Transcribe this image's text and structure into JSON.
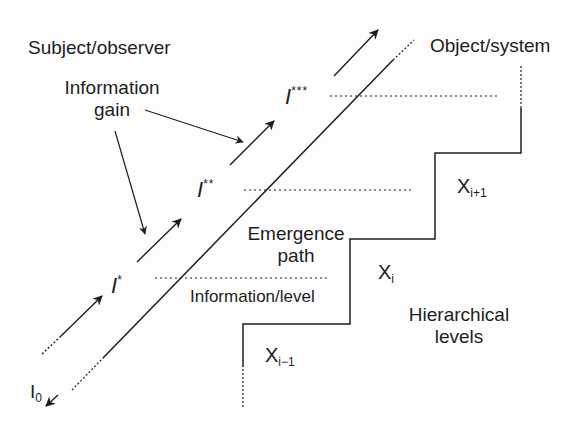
{
  "labels": {
    "subject_observer": "Subject/observer",
    "information_gain_line1": "Information",
    "information_gain_line2": "gain",
    "object_system": "Object/system",
    "emergence_path_line1": "Emergence",
    "emergence_path_line2": "path",
    "information_level": "Information/level",
    "hierarchical_levels_line1": "Hierarchical",
    "hierarchical_levels_line2": "levels"
  },
  "information_states": [
    {
      "base": "I",
      "sup": "",
      "sub": "0"
    },
    {
      "base": "I",
      "sup": "*"
    },
    {
      "base": "I",
      "sup": "**"
    },
    {
      "base": "I",
      "sup": "***"
    }
  ],
  "levels": [
    {
      "base": "X",
      "sub": "i−1"
    },
    {
      "base": "X",
      "sub": "i"
    },
    {
      "base": "X",
      "sub": "i+1"
    }
  ],
  "colors": {
    "ink": "#1e1e1e",
    "background": "#fdfdfd"
  }
}
